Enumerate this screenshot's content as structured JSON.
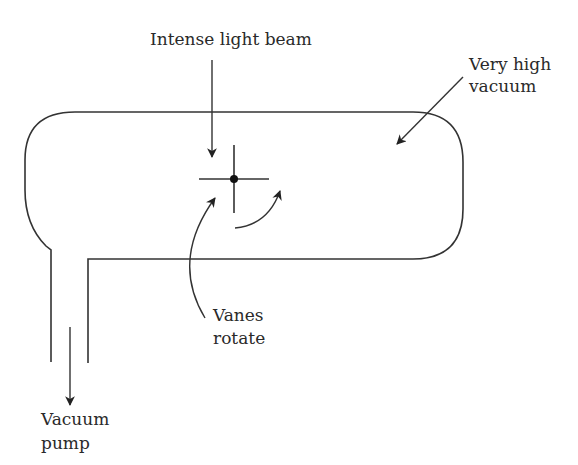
{
  "diagram": {
    "labels": {
      "light_beam": "Intense light beam",
      "vacuum_line1": "Very high",
      "vacuum_line2": "vacuum",
      "vanes_line1": "Vanes",
      "vanes_line2": "rotate",
      "pump_line1": "Vacuum",
      "pump_line2": "pump"
    },
    "colors": {
      "stroke": "#333333",
      "text": "#2a2a2a",
      "background": "#ffffff"
    }
  }
}
